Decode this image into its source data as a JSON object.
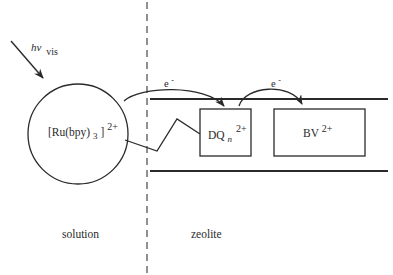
{
  "diagram": {
    "light_label": {
      "main": "hν",
      "sub": "vis"
    },
    "sensitizer": {
      "main": "[Ru(bpy)",
      "sub": "3",
      "close": "]",
      "sup": "2+"
    },
    "relay": {
      "main": "DQ",
      "sub": "n",
      "sup": "2+"
    },
    "acceptor": {
      "main": "BV",
      "sup": "2+"
    },
    "electron_transfer_1": {
      "main": "e",
      "sup": "-"
    },
    "electron_transfer_2": {
      "main": "e",
      "sup": "-"
    },
    "region_left": "solution",
    "region_right": "zeolite"
  },
  "colors": {
    "ink": "#2a2a2a",
    "background": "#ffffff"
  }
}
